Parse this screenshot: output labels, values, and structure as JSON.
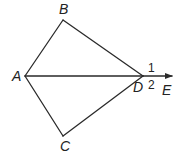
{
  "diagram": {
    "type": "geometry",
    "points": {
      "A": {
        "label": "A",
        "x": 25,
        "y": 76
      },
      "B": {
        "label": "B",
        "x": 63,
        "y": 20
      },
      "C": {
        "label": "C",
        "x": 63,
        "y": 136
      },
      "D": {
        "label": "D",
        "x": 143,
        "y": 76
      },
      "E": {
        "label": "E",
        "x": 172,
        "y": 76
      }
    },
    "segments": [
      "AB",
      "BD",
      "AC",
      "CD",
      "AD"
    ],
    "ray": "DE",
    "angle_labels": {
      "angle1": "1",
      "angle2": "2"
    },
    "colors": {
      "stroke": "#2a2a2a",
      "text": "#222222"
    }
  }
}
